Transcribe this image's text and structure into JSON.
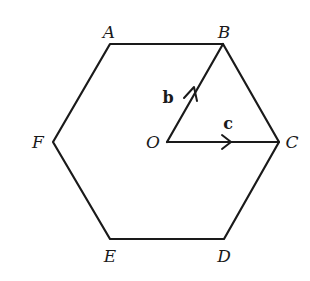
{
  "diagram": {
    "vertices": [
      {
        "name": "A",
        "label": "A",
        "x": 110,
        "y": 44,
        "lx": 109,
        "ly": 38
      },
      {
        "name": "B",
        "label": "B",
        "x": 223,
        "y": 44,
        "lx": 224,
        "ly": 38
      },
      {
        "name": "C",
        "label": "C",
        "x": 279,
        "y": 142,
        "lx": 292,
        "ly": 148
      },
      {
        "name": "D",
        "label": "D",
        "x": 224,
        "y": 239,
        "lx": 224,
        "ly": 262
      },
      {
        "name": "E",
        "label": "E",
        "x": 110,
        "y": 239,
        "lx": 110,
        "ly": 262
      },
      {
        "name": "F",
        "label": "F",
        "x": 53,
        "y": 142,
        "lx": 38,
        "ly": 148
      }
    ],
    "centre": {
      "name": "O",
      "label": "O",
      "x": 167,
      "y": 142,
      "lx": 153,
      "ly": 148
    },
    "vectors": [
      {
        "name": "b",
        "label": "b",
        "from": "O",
        "to": "B",
        "lx": 168,
        "ly": 103
      },
      {
        "name": "c",
        "label": "c",
        "from": "O",
        "to": "C",
        "lx": 228,
        "ly": 129
      }
    ],
    "colors": {
      "stroke": "#1a1a1a",
      "background": "#ffffff"
    }
  }
}
